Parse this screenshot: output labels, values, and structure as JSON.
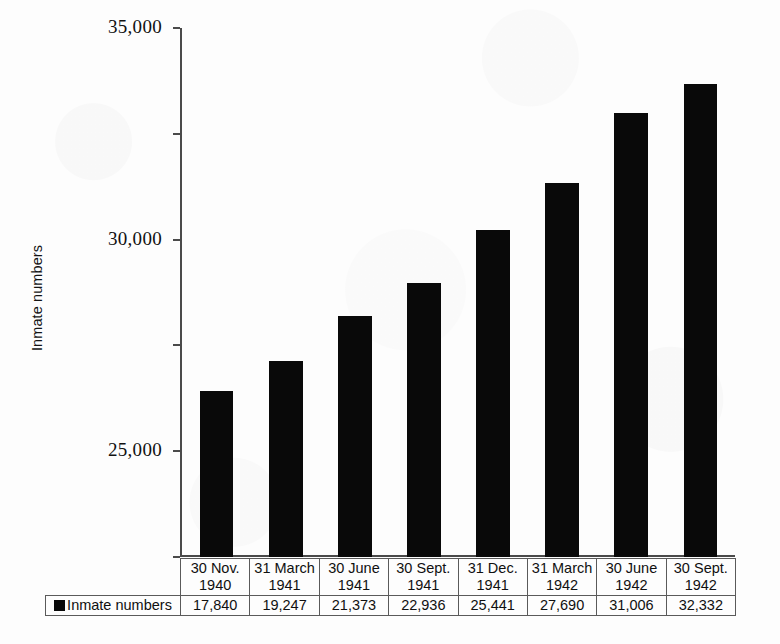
{
  "chart_data": {
    "type": "bar",
    "title": "",
    "xlabel": "",
    "ylabel": "Inmate numbers",
    "ylim": [
      10000,
      35000
    ],
    "ytick_values": [
      35000,
      30000,
      25000,
      20000,
      15000,
      10000
    ],
    "ytick_labels": [
      "35,000",
      "30,000",
      "25,000",
      "20,000",
      "15,000",
      "10,000"
    ],
    "grid": false,
    "legend_position": "bottom-left-table",
    "bar_color": "#090909",
    "categories": [
      "30 Nov. 1940",
      "31 March 1941",
      "30 June 1941",
      "30 Sept. 1941",
      "31 Dec. 1941",
      "31 March 1942",
      "30 June 1942",
      "30 Sept. 1942"
    ],
    "category_lines": [
      [
        "30 Nov.",
        "1940"
      ],
      [
        "31 March",
        "1941"
      ],
      [
        "30 June",
        "1941"
      ],
      [
        "30 Sept.",
        "1941"
      ],
      [
        "31 Dec.",
        "1941"
      ],
      [
        "31 March",
        "1942"
      ],
      [
        "30 June",
        "1942"
      ],
      [
        "30 Sept.",
        "1942"
      ]
    ],
    "series": [
      {
        "name": "Inmate numbers",
        "values": [
          17840,
          19247,
          21373,
          22936,
          25441,
          27690,
          31006,
          32332
        ],
        "value_labels": [
          "17,840",
          "19,247",
          "21,373",
          "22,936",
          "25,441",
          "27,690",
          "31,006",
          "32,332"
        ]
      }
    ]
  },
  "legend": {
    "series_label": "Inmate numbers"
  },
  "axis": {
    "y_title": "Inmate numbers"
  }
}
